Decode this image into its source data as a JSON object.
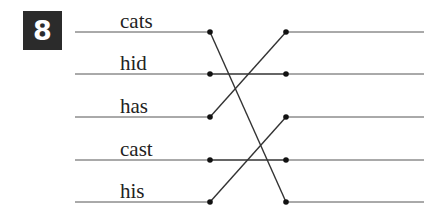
{
  "exercise": {
    "number": "8",
    "badge_color": "#2b2b2b",
    "line_color": "#333333"
  },
  "words": [
    {
      "label": "cats",
      "row": 0
    },
    {
      "label": "hid",
      "row": 1
    },
    {
      "label": "has",
      "row": 2
    },
    {
      "label": "cast",
      "row": 3
    },
    {
      "label": "his",
      "row": 4
    }
  ],
  "rows_y": [
    32,
    74,
    117,
    160,
    202
  ],
  "connections": [
    {
      "from_row": 0,
      "to_row": 4
    },
    {
      "from_row": 1,
      "to_row": 1
    },
    {
      "from_row": 2,
      "to_row": 0
    },
    {
      "from_row": 3,
      "to_row": 3
    },
    {
      "from_row": 4,
      "to_row": 2
    }
  ]
}
